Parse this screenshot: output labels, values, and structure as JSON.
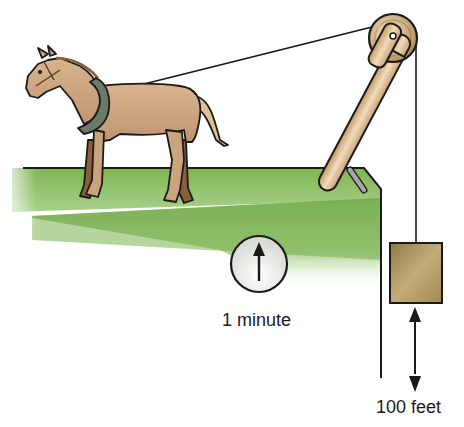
{
  "diagram": {
    "labels": {
      "time": "1 minute",
      "distance": "100 feet"
    },
    "elements": {
      "horse": "horse-pulling-rope",
      "pulley": "pulley-on-wooden-boom",
      "weight": "hanging-load-block",
      "clock": "clock-dial",
      "ground": "green-platform-edge"
    },
    "colors": {
      "ground_green": "#79b04e",
      "horse_body": "#c9a47c",
      "horse_dark": "#8b5e3c",
      "collar": "#6b7a66",
      "wood": "#d9b98c",
      "weight_box": "#a89360",
      "outline": "#1a1a1a"
    }
  }
}
